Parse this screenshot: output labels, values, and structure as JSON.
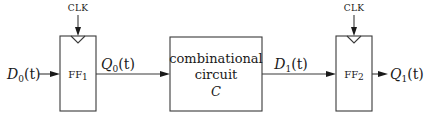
{
  "diagram": {
    "type": "sequential-circuit-block-diagram",
    "flip_flops": [
      {
        "id": "ff1",
        "label": "FF",
        "subscript": "1",
        "clock_label": "CLK"
      },
      {
        "id": "ff2",
        "label": "FF",
        "subscript": "2",
        "clock_label": "CLK"
      }
    ],
    "combinational": {
      "line1": "combinational",
      "line2": "circuit",
      "line3": "C"
    },
    "signals": {
      "d0": {
        "base": "D",
        "sub": "0",
        "arg": "(t)"
      },
      "q0": {
        "base": "Q",
        "sub": "0",
        "arg": "(t)"
      },
      "d1": {
        "base": "D",
        "sub": "1",
        "arg": "(t)"
      },
      "q1": {
        "base": "Q",
        "sub": "1",
        "arg": "(t)"
      }
    },
    "connections": [
      {
        "from": "D0(t)",
        "to": "FF1"
      },
      {
        "from": "FF1",
        "to": "combinational circuit C",
        "label": "Q0(t)"
      },
      {
        "from": "combinational circuit C",
        "to": "FF2",
        "label": "D1(t)"
      },
      {
        "from": "FF2",
        "to": "Q1(t)"
      },
      {
        "from": "CLK",
        "to": "FF1"
      },
      {
        "from": "CLK",
        "to": "FF2"
      }
    ],
    "colors": {
      "stroke": "#3a3a3a",
      "text": "#1a1a1a",
      "background": "#ffffff"
    }
  }
}
